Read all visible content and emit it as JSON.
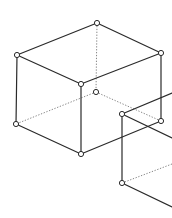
{
  "diagram": {
    "colors": {
      "edge": "#2a2a2a",
      "hidden_edge": "#777777",
      "vertex_fill": "#ffffff"
    },
    "vertex_radius": 2.6,
    "vertices": [
      {
        "id": "cube1-top-back",
        "x": 97,
        "y": 23
      },
      {
        "id": "cube1-top-left",
        "x": 17,
        "y": 55
      },
      {
        "id": "cube1-top-right",
        "x": 161,
        "y": 53
      },
      {
        "id": "cube1-top-front",
        "x": 81,
        "y": 84
      },
      {
        "id": "cube1-bottom-back-hidden",
        "x": 96,
        "y": 92
      },
      {
        "id": "cube1-bottom-left",
        "x": 16,
        "y": 124
      },
      {
        "id": "cube1-bottom-right",
        "x": 161,
        "y": 121
      },
      {
        "id": "cube1-bottom-front",
        "x": 81,
        "y": 154
      },
      {
        "id": "cube2-top-left",
        "x": 122,
        "y": 114
      },
      {
        "id": "cube2-bottom-left",
        "x": 122,
        "y": 183
      }
    ],
    "edges": [
      {
        "from": [
          97,
          23
        ],
        "to": [
          17,
          55
        ]
      },
      {
        "from": [
          97,
          23
        ],
        "to": [
          161,
          53
        ]
      },
      {
        "from": [
          17,
          55
        ],
        "to": [
          81,
          84
        ]
      },
      {
        "from": [
          161,
          53
        ],
        "to": [
          81,
          84
        ]
      },
      {
        "from": [
          17,
          55
        ],
        "to": [
          16,
          124
        ]
      },
      {
        "from": [
          81,
          84
        ],
        "to": [
          81,
          154
        ]
      },
      {
        "from": [
          161,
          53
        ],
        "to": [
          161,
          121
        ]
      },
      {
        "from": [
          16,
          124
        ],
        "to": [
          81,
          154
        ]
      },
      {
        "from": [
          81,
          154
        ],
        "to": [
          161,
          121
        ]
      },
      {
        "from": [
          122,
          114
        ],
        "to": [
          172,
          93
        ]
      },
      {
        "from": [
          122,
          114
        ],
        "to": [
          172,
          138
        ]
      },
      {
        "from": [
          122,
          114
        ],
        "to": [
          122,
          183
        ]
      },
      {
        "from": [
          122,
          183
        ],
        "to": [
          172,
          207
        ]
      }
    ],
    "hidden_edges": [
      {
        "from": [
          97,
          23
        ],
        "to": [
          96,
          92
        ]
      },
      {
        "from": [
          96,
          92
        ],
        "to": [
          16,
          124
        ]
      },
      {
        "from": [
          96,
          92
        ],
        "to": [
          161,
          121
        ]
      },
      {
        "from": [
          122,
          183
        ],
        "to": [
          172,
          164
        ]
      }
    ]
  }
}
